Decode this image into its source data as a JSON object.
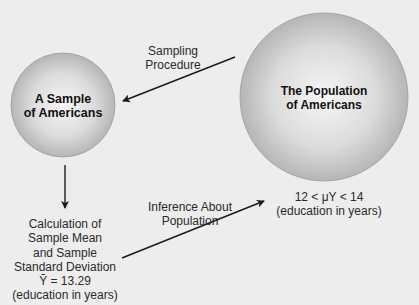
{
  "nodes": {
    "sample": {
      "line1": "A Sample",
      "line2": "of Americans"
    },
    "population": {
      "line1": "The Population",
      "line2": "of Americans"
    }
  },
  "arrows": {
    "sampling": {
      "line1": "Sampling",
      "line2": "Procedure"
    },
    "inference": {
      "line1": "Inference About",
      "line2": "Population"
    }
  },
  "calculation": {
    "line1": "Calculation of",
    "line2": "Sample Mean",
    "line3": "and Sample",
    "line4": "Standard Deviation",
    "line5": "Ȳ = 13.29",
    "line6": "(education in years)"
  },
  "population_estimate": {
    "line1": "12 < μY < 14",
    "line2": "(education in years)"
  },
  "colors": {
    "background": "#ededed",
    "circle_center": "#f4f4f4",
    "circle_edge": "#b8b8b8",
    "arrow": "#1a1a1a"
  }
}
